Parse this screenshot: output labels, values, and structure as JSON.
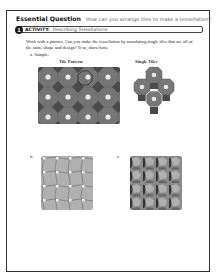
{
  "essential_question": {
    "label": "Essential Question",
    "question": "How can you arrange tiles to make a tessellation?"
  },
  "activity": {
    "number": "1",
    "label": "ACTIVITY:",
    "title": "Describing Tessellations"
  },
  "instructions": "Work with a partner. Can you make the tessellation by translating single tiles that are all of the same shape and design? If so, show how.",
  "parts": {
    "a": {
      "label": "a.",
      "name": "Sample:",
      "columns": [
        "Tile Pattern",
        "Single Tiles"
      ]
    },
    "b": {
      "label": "b."
    },
    "c": {
      "label": "c."
    }
  },
  "colors": {
    "frame_border": "#333333",
    "badge_bg": "#1a1a1a",
    "tile_pattern_octagon": "#6e6e6e",
    "tile_pattern_square": "#4a4a4a",
    "tile_pattern_dot": "#e8e8e8",
    "tile_b_bg": "#b5b5b5",
    "tile_c_dark": "#3a3a3a",
    "tile_c_light": "#a8a8a8"
  }
}
